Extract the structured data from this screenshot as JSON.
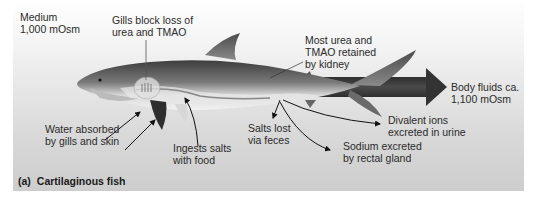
{
  "figure": {
    "caption_tag": "(a)",
    "caption_title": "Cartilaginous fish",
    "colors": {
      "panel_top": "#ffffff",
      "panel_bottom": "#cdcdcd",
      "arrow": "#3a3a3a",
      "text": "#2a2a2a"
    }
  },
  "labels": {
    "medium": {
      "line1": "Medium",
      "line2": "1,000 mOsm"
    },
    "gills": {
      "line1": "Gills block loss of",
      "line2": "urea and TMAO"
    },
    "kidney": {
      "line1": "Most urea and",
      "line2": "TMAO retained",
      "line3": "by kidney"
    },
    "body_fluids": {
      "line1": "Body fluids ca.",
      "line2": "1,100 mOsm"
    },
    "water": {
      "line1": "Water absorbed",
      "line2": "by gills and skin"
    },
    "ingests": {
      "line1": "Ingests salts",
      "line2": "with food"
    },
    "feces": {
      "line1": "Salts lost",
      "line2": "via feces"
    },
    "divalent": {
      "line1": "Divalent ions",
      "line2": "excreted in urine"
    },
    "sodium": {
      "line1": "Sodium excreted",
      "line2": "by rectal gland"
    }
  }
}
